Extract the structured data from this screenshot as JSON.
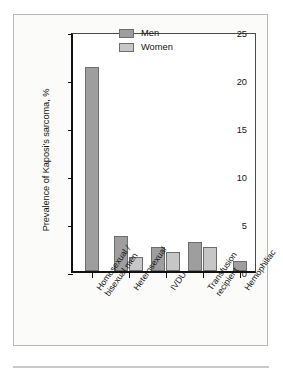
{
  "figure": {
    "background_color": "#fbfbfa",
    "border_color": "#b9b9b4"
  },
  "legend": {
    "position": "top-right-inside",
    "entries": [
      {
        "label": "Men",
        "color": "#9e9e9e"
      },
      {
        "label": "Women",
        "color": "#c6c6c6"
      }
    ]
  },
  "chart_data": {
    "type": "bar",
    "title": "",
    "xlabel": "",
    "ylabel": "Prevalence of Kaposi's sarcoma, %",
    "ylim": [
      0,
      25
    ],
    "yticks": [
      0,
      5,
      10,
      15,
      20,
      25
    ],
    "ytick_labels": [
      "0",
      "5",
      "10",
      "15",
      "20",
      "25"
    ],
    "grid": false,
    "legend_position": "upper right",
    "categories": [
      "Homosexual / bisexual men",
      "Heterosexual",
      "IVDU",
      "Transfusion recipient",
      "Hemophiliac"
    ],
    "category_lines": [
      [
        "Homosexual /",
        "bisexual men"
      ],
      [
        "Heterosexual"
      ],
      [
        "IVDU"
      ],
      [
        "Transfusion",
        "recipient"
      ],
      [
        "Hemophiliac"
      ]
    ],
    "series": [
      {
        "name": "Men",
        "color": "#9e9e9e",
        "values": [
          21.2,
          3.6,
          2.5,
          3.0,
          1.0
        ]
      },
      {
        "name": "Women",
        "color": "#c6c6c6",
        "values": [
          null,
          1.5,
          2.0,
          2.5,
          null
        ]
      }
    ]
  }
}
